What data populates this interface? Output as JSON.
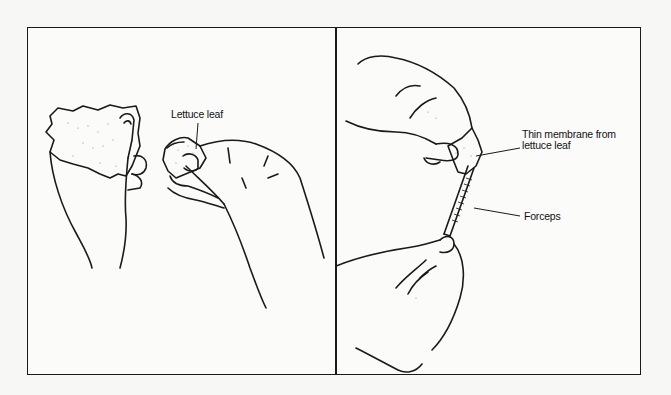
{
  "figure": {
    "panels": [
      {
        "id": "left",
        "description": "Two hands tearing a lettuce leaf",
        "labels": [
          {
            "text": "Lettuce leaf"
          }
        ]
      },
      {
        "id": "right",
        "description": "Hands peeling a thin membrane from lettuce leaf with forceps",
        "labels": [
          {
            "line1": "Thin membrane from",
            "line2": "lettuce leaf"
          },
          {
            "text": "Forceps"
          }
        ]
      }
    ],
    "colors": {
      "line": "#1a1a1a",
      "background": "#fbfbfa"
    }
  }
}
